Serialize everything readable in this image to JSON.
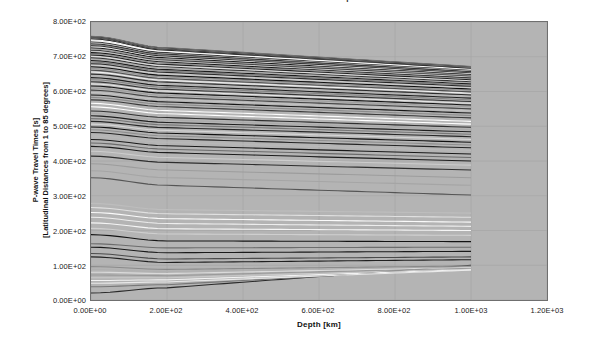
{
  "chart_data": {
    "type": "line",
    "title": "P-wave Travel Times vs. Depth",
    "xlabel": "Depth [km]",
    "ylabel_line1": "P-wave Travel Times [s]",
    "ylabel_line2": "[Latitudinal Distances from 1 to 85 degrees]",
    "xlim": [
      0,
      1200
    ],
    "ylim": [
      0,
      800
    ],
    "xticks": [
      "0.00E+00",
      "2.00E+02",
      "4.00E+02",
      "6.00E+02",
      "8.00E+02",
      "1.00E+03",
      "1.20E+03"
    ],
    "xtick_values": [
      0,
      200,
      400,
      600,
      800,
      1000,
      1200
    ],
    "yticks": [
      "0.00E+00",
      "1.00E+02",
      "2.00E+02",
      "3.00E+02",
      "4.00E+02",
      "5.00E+02",
      "6.00E+02",
      "7.00E+02",
      "8.00E+02"
    ],
    "ytick_values": [
      0,
      100,
      200,
      300,
      400,
      500,
      600,
      700,
      800
    ],
    "grid": true,
    "legend": "none",
    "x_data_range": [
      0,
      1000
    ],
    "plot_bgcolor": "#b4b4b4",
    "figure_bgcolor": "#ffffff",
    "axis_color": "#6f6f6f",
    "n_series": 85,
    "series_note": "85 travel-time curves, one per latitudinal distance from 1 to 85 degrees; each curve plotted at depths 0 to 1000 km.",
    "series": [
      {
        "name": "1 deg",
        "color": "#2a2a2a",
        "y0": 20,
        "ymid": 35,
        "y1000": 100
      },
      {
        "name": "2 deg",
        "color": "#787878",
        "y0": 38,
        "ymid": 44,
        "y1000": 92
      },
      {
        "name": "3 deg",
        "color": "#e8e8e8",
        "y0": 48,
        "ymid": 52,
        "y1000": 86
      },
      {
        "name": "4 deg",
        "color": "#f2f2f2",
        "y0": 56,
        "ymid": 58,
        "y1000": 88
      },
      {
        "name": "5 deg",
        "color": "#c8c8c8",
        "y0": 64,
        "ymid": 64,
        "y1000": 90
      },
      {
        "name": "6 deg",
        "color": "#9a9a9a",
        "y0": 72,
        "ymid": 70,
        "y1000": 92
      },
      {
        "name": "7 deg",
        "color": "#dadada",
        "y0": 80,
        "ymid": 76,
        "y1000": 94
      },
      {
        "name": "8 deg",
        "color": "#b0b0b0",
        "y0": 88,
        "ymid": 82,
        "y1000": 96
      },
      {
        "name": "9 deg",
        "color": "#8a8a8a",
        "y0": 96,
        "ymid": 88,
        "y1000": 98
      },
      {
        "name": "10 deg",
        "color": "#202020",
        "y0": 124,
        "ymid": 108,
        "y1000": 116
      },
      {
        "name": "11 deg",
        "color": "#4a4a4a",
        "y0": 134,
        "ymid": 118,
        "y1000": 124
      },
      {
        "name": "12 deg",
        "color": "#1a1a1a",
        "y0": 152,
        "ymid": 136,
        "y1000": 140
      },
      {
        "name": "13 deg",
        "color": "#6c6c6c",
        "y0": 162,
        "ymid": 150,
        "y1000": 152
      },
      {
        "name": "14 deg",
        "color": "#141414",
        "y0": 188,
        "ymid": 170,
        "y1000": 168
      },
      {
        "name": "15 deg",
        "color": "#cfcfcf",
        "y0": 206,
        "ymid": 190,
        "y1000": 186
      },
      {
        "name": "16 deg",
        "color": "#f5f5f5",
        "y0": 222,
        "ymid": 205,
        "y1000": 200
      },
      {
        "name": "17 deg",
        "color": "#ededed",
        "y0": 238,
        "ymid": 220,
        "y1000": 212
      },
      {
        "name": "18 deg",
        "color": "#fafafa",
        "y0": 252,
        "ymid": 234,
        "y1000": 224
      },
      {
        "name": "19 deg",
        "color": "#e0e0e0",
        "y0": 266,
        "ymid": 248,
        "y1000": 238
      },
      {
        "name": "20 deg",
        "color": "#bdbdbd",
        "y0": 278,
        "ymid": 260,
        "y1000": 250
      },
      {
        "name": "21 deg",
        "color": "#555555",
        "y0": 352,
        "ymid": 330,
        "y1000": 302
      },
      {
        "name": "22 deg",
        "color": "#a5a5a5",
        "y0": 372,
        "ymid": 352,
        "y1000": 330
      },
      {
        "name": "23 deg",
        "color": "#9c9c9c",
        "y0": 392,
        "ymid": 374,
        "y1000": 352
      },
      {
        "name": "24 deg",
        "color": "#2e2e2e",
        "y0": 414,
        "ymid": 396,
        "y1000": 374
      },
      {
        "name": "25 deg",
        "color": "#cccccc",
        "y0": 428,
        "ymid": 410,
        "y1000": 388
      },
      {
        "name": "26 deg",
        "color": "#1c1c1c",
        "y0": 442,
        "ymid": 424,
        "y1000": 400
      },
      {
        "name": "27 deg",
        "color": "#6a6a6a",
        "y0": 452,
        "ymid": 434,
        "y1000": 410
      },
      {
        "name": "28 deg",
        "color": "#181818",
        "y0": 462,
        "ymid": 444,
        "y1000": 420
      },
      {
        "name": "29 deg",
        "color": "#b8b8b8",
        "y0": 472,
        "ymid": 454,
        "y1000": 430
      },
      {
        "name": "30 deg",
        "color": "#242424",
        "y0": 482,
        "ymid": 464,
        "y1000": 438
      },
      {
        "name": "31 deg",
        "color": "#8e8e8e",
        "y0": 490,
        "ymid": 472,
        "y1000": 446
      },
      {
        "name": "32 deg",
        "color": "#101010",
        "y0": 498,
        "ymid": 480,
        "y1000": 454
      },
      {
        "name": "33 deg",
        "color": "#d6d6d6",
        "y0": 506,
        "ymid": 488,
        "y1000": 462
      },
      {
        "name": "34 deg",
        "color": "#262626",
        "y0": 514,
        "ymid": 496,
        "y1000": 470
      },
      {
        "name": "35 deg",
        "color": "#777777",
        "y0": 522,
        "ymid": 504,
        "y1000": 477
      },
      {
        "name": "36 deg",
        "color": "#1e1e1e",
        "y0": 530,
        "ymid": 511,
        "y1000": 484
      },
      {
        "name": "37 deg",
        "color": "#ababab",
        "y0": 537,
        "ymid": 518,
        "y1000": 490
      },
      {
        "name": "38 deg",
        "color": "#303030",
        "y0": 544,
        "ymid": 525,
        "y1000": 497
      },
      {
        "name": "39 deg",
        "color": "#ffffff",
        "y0": 556,
        "ymid": 536,
        "y1000": 506
      },
      {
        "name": "40 deg",
        "color": "#fcfcfc",
        "y0": 566,
        "ymid": 545,
        "y1000": 514
      },
      {
        "name": "41 deg",
        "color": "#3a3a3a",
        "y0": 576,
        "ymid": 556,
        "y1000": 524
      },
      {
        "name": "42 deg",
        "color": "#8b8b8b",
        "y0": 583,
        "ymid": 563,
        "y1000": 531
      },
      {
        "name": "43 deg",
        "color": "#161616",
        "y0": 590,
        "ymid": 570,
        "y1000": 538
      },
      {
        "name": "44 deg",
        "color": "#c2c2c2",
        "y0": 597,
        "ymid": 577,
        "y1000": 544
      },
      {
        "name": "45 deg",
        "color": "#444444",
        "y0": 604,
        "ymid": 583,
        "y1000": 550
      },
      {
        "name": "46 deg",
        "color": "#9f9f9f",
        "y0": 610,
        "ymid": 589,
        "y1000": 556
      },
      {
        "name": "47 deg",
        "color": "#121212",
        "y0": 616,
        "ymid": 595,
        "y1000": 561
      },
      {
        "name": "48 deg",
        "color": "#e4e4e4",
        "y0": 622,
        "ymid": 601,
        "y1000": 566
      },
      {
        "name": "49 deg",
        "color": "#353535",
        "y0": 628,
        "ymid": 606,
        "y1000": 571
      },
      {
        "name": "50 deg",
        "color": "#868686",
        "y0": 634,
        "ymid": 612,
        "y1000": 576
      },
      {
        "name": "51 deg",
        "color": "#1f1f1f",
        "y0": 640,
        "ymid": 617,
        "y1000": 581
      },
      {
        "name": "52 deg",
        "color": "#b6b6b6",
        "y0": 645,
        "ymid": 622,
        "y1000": 586
      },
      {
        "name": "53 deg",
        "color": "#2c2c2c",
        "y0": 650,
        "ymid": 627,
        "y1000": 590
      },
      {
        "name": "54 deg",
        "color": "#f0f0f0",
        "y0": 656,
        "ymid": 632,
        "y1000": 595
      },
      {
        "name": "55 deg",
        "color": "#4e4e4e",
        "y0": 661,
        "ymid": 637,
        "y1000": 599
      },
      {
        "name": "56 deg",
        "color": "#949494",
        "y0": 666,
        "ymid": 642,
        "y1000": 603
      },
      {
        "name": "57 deg",
        "color": "#0e0e0e",
        "y0": 671,
        "ymid": 646,
        "y1000": 607
      },
      {
        "name": "58 deg",
        "color": "#d0d0d0",
        "y0": 676,
        "ymid": 651,
        "y1000": 611
      },
      {
        "name": "59 deg",
        "color": "#282828",
        "y0": 680,
        "ymid": 655,
        "y1000": 615
      },
      {
        "name": "60 deg",
        "color": "#7e7e7e",
        "y0": 685,
        "ymid": 659,
        "y1000": 618
      },
      {
        "name": "61 deg",
        "color": "#1b1b1b",
        "y0": 689,
        "ymid": 663,
        "y1000": 622
      },
      {
        "name": "62 deg",
        "color": "#aeaeae",
        "y0": 693,
        "ymid": 667,
        "y1000": 625
      },
      {
        "name": "63 deg",
        "color": "#333333",
        "y0": 697,
        "ymid": 671,
        "y1000": 628
      },
      {
        "name": "64 deg",
        "color": "#dcdcdc",
        "y0": 701,
        "ymid": 674,
        "y1000": 631
      },
      {
        "name": "65 deg",
        "color": "#212121",
        "y0": 705,
        "ymid": 678,
        "y1000": 634
      },
      {
        "name": "66 deg",
        "color": "#909090",
        "y0": 709,
        "ymid": 681,
        "y1000": 637
      },
      {
        "name": "67 deg",
        "color": "#151515",
        "y0": 712,
        "ymid": 685,
        "y1000": 640
      },
      {
        "name": "68 deg",
        "color": "#c6c6c6",
        "y0": 716,
        "ymid": 688,
        "y1000": 642
      },
      {
        "name": "69 deg",
        "color": "#3d3d3d",
        "y0": 719,
        "ymid": 691,
        "y1000": 645
      },
      {
        "name": "70 deg",
        "color": "#a0a0a0",
        "y0": 722,
        "ymid": 694,
        "y1000": 647
      },
      {
        "name": "71 deg",
        "color": "#191919",
        "y0": 726,
        "ymid": 697,
        "y1000": 650
      },
      {
        "name": "72 deg",
        "color": "#eaeaea",
        "y0": 729,
        "ymid": 700,
        "y1000": 652
      },
      {
        "name": "73 deg",
        "color": "#2f2f2f",
        "y0": 732,
        "ymid": 702,
        "y1000": 654
      },
      {
        "name": "74 deg",
        "color": "#828282",
        "y0": 735,
        "ymid": 705,
        "y1000": 656
      },
      {
        "name": "75 deg",
        "color": "#111111",
        "y0": 738,
        "ymid": 708,
        "y1000": 658
      },
      {
        "name": "76 deg",
        "color": "#bababa",
        "y0": 740,
        "ymid": 710,
        "y1000": 660
      },
      {
        "name": "77 deg",
        "color": "#3b3b3b",
        "y0": 743,
        "ymid": 712,
        "y1000": 662
      },
      {
        "name": "78 deg",
        "color": "#fefefe",
        "y0": 746,
        "ymid": 715,
        "y1000": 664
      },
      {
        "name": "79 deg",
        "color": "#f8f8f8",
        "y0": 749,
        "ymid": 717,
        "y1000": 666
      },
      {
        "name": "80 deg",
        "color": "#1d1d1d",
        "y0": 752,
        "ymid": 719,
        "y1000": 667
      },
      {
        "name": "81 deg",
        "color": "#606060",
        "y0": 754,
        "ymid": 721,
        "y1000": 668
      },
      {
        "name": "82 deg",
        "color": "#0c0c0c",
        "y0": 756,
        "ymid": 723,
        "y1000": 669
      },
      {
        "name": "83 deg",
        "color": "#a8a8a8",
        "y0": 757,
        "ymid": 724,
        "y1000": 670
      },
      {
        "name": "84 deg",
        "color": "#2b2b2b",
        "y0": 758,
        "ymid": 725,
        "y1000": 671
      },
      {
        "name": "85 deg",
        "color": "#707070",
        "y0": 759,
        "ymid": 726,
        "y1000": 672
      }
    ]
  }
}
